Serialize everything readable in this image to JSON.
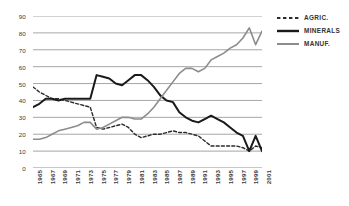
{
  "chart_data": {
    "type": "line",
    "title": "",
    "subtitle": "",
    "xlabel": "",
    "ylabel": "",
    "xlim": [
      1965,
      2001
    ],
    "ylim": [
      0,
      90
    ],
    "grid": true,
    "grid_axis": "y",
    "legend_position": "right",
    "y_ticks": [
      90,
      80,
      70,
      60,
      50,
      40,
      30,
      20,
      10,
      0
    ],
    "x_ticks": [
      "1965",
      "1967",
      "1969",
      "1971",
      "1973",
      "1975",
      "1977",
      "1979",
      "1981",
      "1983",
      "1985",
      "1987",
      "1989",
      "1991",
      "1993",
      "1995",
      "1997",
      "1999",
      "2001"
    ],
    "x": [
      1965,
      1966,
      1967,
      1968,
      1969,
      1970,
      1971,
      1972,
      1973,
      1974,
      1975,
      1976,
      1977,
      1978,
      1979,
      1980,
      1981,
      1982,
      1983,
      1984,
      1985,
      1986,
      1987,
      1988,
      1989,
      1990,
      1991,
      1992,
      1993,
      1994,
      1995,
      1996,
      1997,
      1998,
      1999,
      2000,
      2001
    ],
    "series": [
      {
        "name": "AGRIC.",
        "style": "dashed",
        "color": "#2b2b2b",
        "width": 1.4,
        "values": [
          48,
          45,
          43,
          41,
          41,
          40,
          39,
          38,
          37,
          36,
          24,
          23,
          24,
          25,
          26,
          24,
          20,
          18,
          19,
          20,
          20,
          21,
          22,
          21,
          21,
          20,
          19,
          16,
          13,
          13,
          13,
          13,
          13,
          12,
          10,
          13,
          12
        ]
      },
      {
        "name": "MINERALS",
        "style": "solid",
        "color": "#1a1a1a",
        "width": 2.0,
        "values": [
          36,
          38,
          41,
          41,
          40,
          41,
          41,
          41,
          41,
          41,
          55,
          54,
          53,
          50,
          49,
          52,
          55,
          55,
          52,
          48,
          43,
          40,
          39,
          33,
          30,
          28,
          27,
          29,
          31,
          29,
          27,
          24,
          21,
          19,
          10,
          19,
          10
        ]
      },
      {
        "name": "MANUF.",
        "style": "solid",
        "color": "#8c8c8c",
        "width": 1.6,
        "values": [
          17,
          17,
          18,
          20,
          22,
          23,
          24,
          25,
          27,
          27,
          23,
          24,
          26,
          28,
          30,
          30,
          29,
          29,
          32,
          36,
          41,
          46,
          51,
          56,
          59,
          59,
          57,
          59,
          64,
          66,
          68,
          71,
          73,
          77,
          83,
          73,
          81
        ]
      }
    ]
  },
  "legend": {
    "entries": [
      {
        "label": "AGRIC."
      },
      {
        "label": "MINERALS"
      },
      {
        "label": "MANUF."
      }
    ]
  }
}
